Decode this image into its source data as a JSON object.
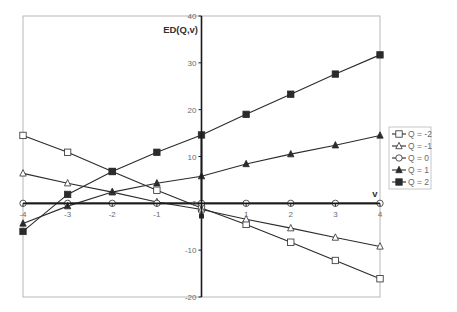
{
  "chart_data": {
    "type": "line",
    "title": "",
    "xlabel": "v",
    "ylabel": "ED(Q,v)",
    "x": [
      -4,
      -3,
      -2,
      -1,
      0,
      1,
      2,
      3,
      4
    ],
    "xlim": [
      -4,
      4
    ],
    "ylim": [
      -20,
      40
    ],
    "x_ticks": [
      "-4",
      "-3",
      "-2",
      "-1",
      "0",
      "1",
      "2",
      "3",
      "4"
    ],
    "y_ticks": [
      "40",
      "30",
      "20",
      "10",
      "0",
      "-10",
      "-20"
    ],
    "y_tick_values": [
      40,
      30,
      20,
      10,
      0,
      -10,
      -20
    ],
    "grid": false,
    "legend_position": "right",
    "series": [
      {
        "name": "Q = -2",
        "marker": "square-open",
        "values": [
          14.5,
          10.9,
          6.8,
          2.8,
          -1.0,
          -4.5,
          -8.3,
          -12.2,
          -16.1
        ]
      },
      {
        "name": "Q = -1",
        "marker": "triangle-open",
        "values": [
          6.4,
          4.3,
          2.4,
          0.3,
          -1.3,
          -3.4,
          -5.3,
          -7.3,
          -9.2
        ]
      },
      {
        "name": "Q = 0",
        "marker": "circle-open",
        "values": [
          0,
          0,
          0,
          0,
          0,
          0,
          0,
          0,
          0
        ]
      },
      {
        "name": "Q = 1",
        "marker": "triangle-filled",
        "values": [
          -4.3,
          -0.6,
          2.4,
          4.3,
          5.8,
          8.4,
          10.5,
          12.4,
          14.5
        ]
      },
      {
        "name": "Q = 2",
        "marker": "square-filled",
        "values": [
          -6.0,
          1.9,
          6.8,
          10.9,
          14.6,
          19.0,
          23.3,
          27.6,
          31.7
        ]
      }
    ],
    "annotations": [
      {
        "type": "spike",
        "x": 0,
        "y_from": 14.6,
        "y_to": -2.7,
        "note": "vertical drop at v = 0 for Q = 1, 2"
      }
    ]
  },
  "colors": {
    "line": "#2b2b2b",
    "axis": "#1a1a1a",
    "frame": "#b8b8b8",
    "tick_text": "#6a6a6a",
    "background": "#ffffff"
  }
}
